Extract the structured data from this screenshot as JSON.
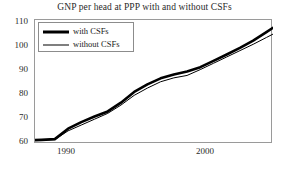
{
  "chart_data": {
    "type": "line",
    "title": "GNP per head at PPP with and without CSFs",
    "xlabel": "",
    "ylabel": "",
    "xlim": [
      1987.5,
      2005.5
    ],
    "ylim": [
      59,
      110
    ],
    "yticks": [
      60,
      70,
      80,
      90,
      100,
      110
    ],
    "xticks": [
      1990,
      2000
    ],
    "xtick_labels": [
      "1990",
      "2000"
    ],
    "grid": false,
    "legend_position": "upper-left-inside",
    "x": [
      1987.5,
      1988,
      1989,
      1990,
      1991,
      1992,
      1993,
      1994,
      1995,
      1996,
      1997,
      1998,
      1999,
      2000,
      2001,
      2002,
      2003,
      2004,
      2005,
      2005.5
    ],
    "series": [
      {
        "name": "with CSFs",
        "line_style": "thick",
        "color": "#000000",
        "values": [
          60.6,
          60.7,
          61.0,
          65.3,
          68.0,
          70.3,
          72.4,
          76.0,
          80.4,
          83.5,
          86.0,
          87.6,
          88.8,
          90.6,
          93.2,
          95.8,
          98.5,
          101.5,
          105.0,
          106.8
        ]
      },
      {
        "name": "without CSFs",
        "line_style": "thin",
        "color": "#000000",
        "values": [
          60.5,
          60.6,
          60.8,
          64.4,
          66.8,
          69.2,
          71.6,
          75.0,
          79.0,
          82.0,
          84.6,
          86.2,
          87.2,
          89.6,
          92.2,
          94.8,
          97.4,
          100.0,
          102.8,
          104.2
        ]
      }
    ]
  },
  "legend": {
    "entries": [
      {
        "label": "with CSFs"
      },
      {
        "label": "without CSFs"
      }
    ]
  },
  "axis": {
    "y_labels": [
      "110",
      "100",
      "90",
      "80",
      "70",
      "60"
    ],
    "x_labels": [
      "1990",
      "2000"
    ]
  },
  "colors": {
    "series_line": "#000000",
    "frame": "#9a9a9a",
    "text": "#1a1a1a",
    "background": "#ffffff"
  }
}
